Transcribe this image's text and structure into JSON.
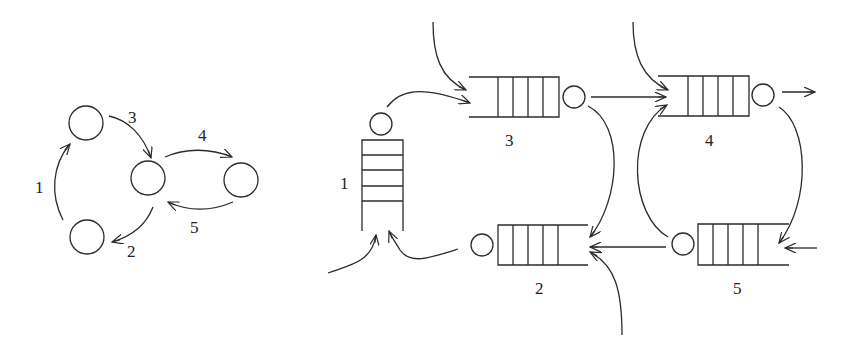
{
  "diagram": {
    "type": "queueing-network",
    "left_graph": {
      "nodes": [
        {
          "id": "A",
          "cx": 86,
          "cy": 123
        },
        {
          "id": "B",
          "cx": 148,
          "cy": 178
        },
        {
          "id": "C",
          "cx": 241,
          "cy": 180
        },
        {
          "id": "D",
          "cx": 87,
          "cy": 237
        }
      ],
      "edges": [
        {
          "label": "1",
          "from": "D",
          "to": "A"
        },
        {
          "label": "2",
          "from": "B",
          "to": "D"
        },
        {
          "label": "3",
          "from": "A",
          "to": "B"
        },
        {
          "label": "4",
          "from": "B",
          "to": "C"
        },
        {
          "label": "5",
          "from": "C",
          "to": "B"
        }
      ]
    },
    "queues": [
      {
        "id": "1",
        "label": "1",
        "orientation": "vertical"
      },
      {
        "id": "2",
        "label": "2",
        "orientation": "horizontal-left"
      },
      {
        "id": "3",
        "label": "3",
        "orientation": "horizontal-right"
      },
      {
        "id": "4",
        "label": "4",
        "orientation": "horizontal-right"
      },
      {
        "id": "5",
        "label": "5",
        "orientation": "horizontal-left"
      }
    ],
    "labels": {
      "edge1": "1",
      "edge2": "2",
      "edge3": "3",
      "edge4": "4",
      "edge5": "5",
      "q1": "1",
      "q2": "2",
      "q3": "3",
      "q4": "4",
      "q5": "5"
    },
    "colors": {
      "stroke": "#2b2b2b",
      "background": "#ffffff"
    }
  }
}
